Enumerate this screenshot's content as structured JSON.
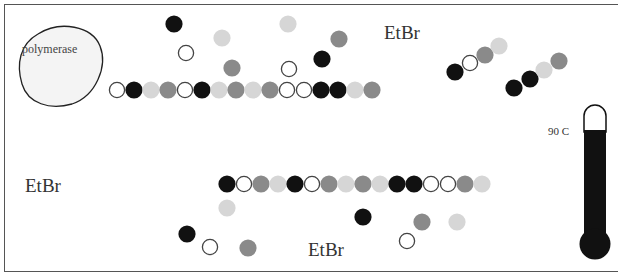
{
  "labels": {
    "polymerase": "polymerase",
    "etbr_top": "EtBr",
    "etbr_left": "EtBr",
    "etbr_bottom": "EtBr",
    "temperature": "90 C"
  },
  "colors": {
    "black": "#111111",
    "gray": "#8a8a8a",
    "light": "#d6d6d6",
    "open_fill": "#ffffff",
    "open_stroke": "#444444",
    "border": "#555555",
    "thermometer": "#111111"
  },
  "strands": {
    "top": {
      "start_x": 117,
      "y": 90,
      "spacing": 17,
      "bases": [
        "open",
        "black",
        "light",
        "gray",
        "open",
        "black",
        "light",
        "gray",
        "light",
        "gray",
        "open",
        "open",
        "black",
        "black",
        "light",
        "gray"
      ]
    },
    "bottom": {
      "start_x": 227,
      "y": 184,
      "spacing": 17,
      "bases": [
        "black",
        "open",
        "gray",
        "light",
        "black",
        "open",
        "gray",
        "light",
        "gray",
        "light",
        "black",
        "black",
        "open",
        "open",
        "gray",
        "light"
      ]
    },
    "diagonal_1": [
      {
        "x": 455,
        "y": 72,
        "t": "black"
      },
      {
        "x": 470,
        "y": 63,
        "t": "open"
      },
      {
        "x": 485,
        "y": 55,
        "t": "gray"
      },
      {
        "x": 499,
        "y": 46,
        "t": "light"
      }
    ],
    "diagonal_2": [
      {
        "x": 514,
        "y": 88,
        "t": "black"
      },
      {
        "x": 530,
        "y": 79,
        "t": "black"
      },
      {
        "x": 544,
        "y": 70,
        "t": "light"
      },
      {
        "x": 559,
        "y": 61,
        "t": "gray"
      }
    ]
  },
  "free_nucleotides": [
    {
      "x": 174,
      "y": 24,
      "t": "black"
    },
    {
      "x": 222,
      "y": 38,
      "t": "light"
    },
    {
      "x": 186,
      "y": 53,
      "t": "open"
    },
    {
      "x": 232,
      "y": 68,
      "t": "gray"
    },
    {
      "x": 288,
      "y": 24,
      "t": "light"
    },
    {
      "x": 339,
      "y": 39,
      "t": "gray"
    },
    {
      "x": 322,
      "y": 59,
      "t": "black"
    },
    {
      "x": 289,
      "y": 69,
      "t": "open"
    },
    {
      "x": 227,
      "y": 208,
      "t": "light"
    },
    {
      "x": 187,
      "y": 234,
      "t": "black"
    },
    {
      "x": 210,
      "y": 247,
      "t": "open"
    },
    {
      "x": 248,
      "y": 248,
      "t": "gray"
    },
    {
      "x": 363,
      "y": 217,
      "t": "black"
    },
    {
      "x": 422,
      "y": 222,
      "t": "gray"
    },
    {
      "x": 457,
      "y": 222,
      "t": "light"
    },
    {
      "x": 407,
      "y": 241,
      "t": "open"
    }
  ]
}
